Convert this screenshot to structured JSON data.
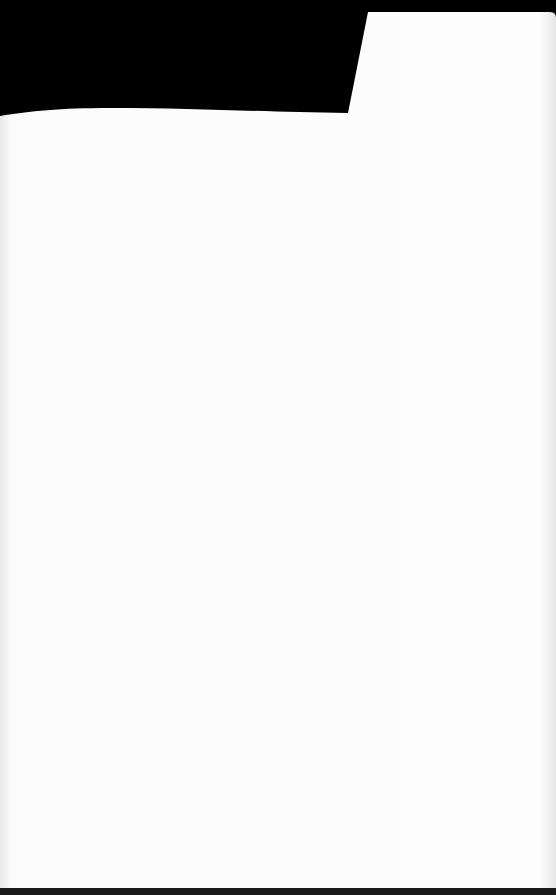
{
  "scene": {
    "description": "Blank white sheet of paper photographed against a black background",
    "colors": {
      "background": "#000000",
      "paper": "#fdfdfd",
      "paper_shadow": "#eeeeee"
    }
  }
}
